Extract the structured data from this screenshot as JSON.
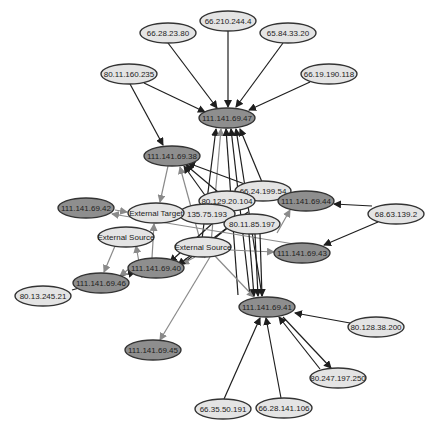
{
  "diagram": {
    "type": "network-graph",
    "colors": {
      "light_node_fill": "#e4e4e4",
      "dark_node_fill": "#8e8e8e",
      "node_stroke": "#333333",
      "dark_edge": "#1e1e1e",
      "gray_edge": "#8a8a8a",
      "background": "#ffffff"
    },
    "nodes": [
      {
        "id": "n1",
        "label": "66.28.23.80",
        "x": 168,
        "y": 33,
        "rx": 28,
        "ry": 10,
        "style": "light"
      },
      {
        "id": "n2",
        "label": "66.210.244.4",
        "x": 228,
        "y": 21,
        "rx": 28,
        "ry": 10,
        "style": "light"
      },
      {
        "id": "n3",
        "label": "65.84.33.20",
        "x": 288,
        "y": 33,
        "rx": 28,
        "ry": 10,
        "style": "light"
      },
      {
        "id": "n4",
        "label": "80.11.160.235",
        "x": 129,
        "y": 74,
        "rx": 28,
        "ry": 10,
        "style": "light"
      },
      {
        "id": "n5",
        "label": "66.19.190.118",
        "x": 329,
        "y": 74,
        "rx": 28,
        "ry": 10,
        "style": "light"
      },
      {
        "id": "n6",
        "label": "111.141.69.47",
        "x": 227,
        "y": 118,
        "rx": 28,
        "ry": 10,
        "style": "dark"
      },
      {
        "id": "n7",
        "label": "111.141.69.38",
        "x": 172,
        "y": 156,
        "rx": 28,
        "ry": 10,
        "style": "dark"
      },
      {
        "id": "n8",
        "label": "66.24.199.54",
        "x": 263,
        "y": 191,
        "rx": 28,
        "ry": 10,
        "style": "light"
      },
      {
        "id": "n9",
        "label": "80.129.20.104",
        "x": 227,
        "y": 201,
        "rx": 28,
        "ry": 10,
        "style": "light"
      },
      {
        "id": "n10",
        "label": "111.141.69.44",
        "x": 306,
        "y": 201,
        "rx": 28,
        "ry": 10,
        "style": "dark"
      },
      {
        "id": "n11",
        "label": "68.63.139.2",
        "x": 396,
        "y": 214,
        "rx": 28,
        "ry": 10,
        "style": "light"
      },
      {
        "id": "n12",
        "label": "111.141.69.42",
        "x": 86,
        "y": 208,
        "rx": 28,
        "ry": 10,
        "style": "dark"
      },
      {
        "id": "n13",
        "label": "135.75.193",
        "x": 207,
        "y": 214,
        "rx": 28,
        "ry": 10,
        "style": "light"
      },
      {
        "id": "n14",
        "label": "External Target",
        "x": 156,
        "y": 213,
        "rx": 28,
        "ry": 10,
        "style": "light"
      },
      {
        "id": "n15",
        "label": "80.11.85.197",
        "x": 252,
        "y": 224,
        "rx": 28,
        "ry": 10,
        "style": "light"
      },
      {
        "id": "n16",
        "label": "External Source",
        "x": 126,
        "y": 237,
        "rx": 28,
        "ry": 10,
        "style": "light"
      },
      {
        "id": "n17",
        "label": "External Source",
        "x": 203,
        "y": 247,
        "rx": 28,
        "ry": 10,
        "style": "light"
      },
      {
        "id": "n18",
        "label": "111.141.69.43",
        "x": 302,
        "y": 253,
        "rx": 28,
        "ry": 10,
        "style": "dark"
      },
      {
        "id": "n19",
        "label": "111.141.69.40",
        "x": 156,
        "y": 268,
        "rx": 28,
        "ry": 10,
        "style": "dark"
      },
      {
        "id": "n20",
        "label": "111.141.69.46",
        "x": 101,
        "y": 283,
        "rx": 28,
        "ry": 10,
        "style": "dark"
      },
      {
        "id": "n21",
        "label": "80.13.245.21",
        "x": 43,
        "y": 296,
        "rx": 28,
        "ry": 10,
        "style": "light"
      },
      {
        "id": "n22",
        "label": "111.141.69.41",
        "x": 267,
        "y": 307,
        "rx": 28,
        "ry": 10,
        "style": "dark"
      },
      {
        "id": "n23",
        "label": "80.128.38.200",
        "x": 376,
        "y": 327,
        "rx": 28,
        "ry": 10,
        "style": "light"
      },
      {
        "id": "n24",
        "label": "111.141.69.45",
        "x": 153,
        "y": 350,
        "rx": 28,
        "ry": 10,
        "style": "dark"
      },
      {
        "id": "n25",
        "label": "80.247.197.250",
        "x": 338,
        "y": 378,
        "rx": 28,
        "ry": 10,
        "style": "light"
      },
      {
        "id": "n26",
        "label": "66.35.50.191",
        "x": 223,
        "y": 409,
        "rx": 28,
        "ry": 10,
        "style": "light"
      },
      {
        "id": "n27",
        "label": "66.28.141.106",
        "x": 284,
        "y": 408,
        "rx": 28,
        "ry": 10,
        "style": "light"
      }
    ],
    "edges": [
      {
        "x1": 168,
        "y1": 43,
        "x2": 217,
        "y2": 108,
        "style": "dark"
      },
      {
        "x1": 228,
        "y1": 31,
        "x2": 228,
        "y2": 107,
        "style": "dark"
      },
      {
        "x1": 283,
        "y1": 43,
        "x2": 236,
        "y2": 107,
        "style": "dark"
      },
      {
        "x1": 144,
        "y1": 83,
        "x2": 205,
        "y2": 112,
        "style": "dark"
      },
      {
        "x1": 310,
        "y1": 82,
        "x2": 249,
        "y2": 110,
        "style": "dark"
      },
      {
        "x1": 130,
        "y1": 84,
        "x2": 163,
        "y2": 145,
        "style": "dark"
      },
      {
        "x1": 200,
        "y1": 255,
        "x2": 216,
        "y2": 129,
        "style": "dark"
      },
      {
        "x1": 210,
        "y1": 255,
        "x2": 221,
        "y2": 129,
        "style": "gray"
      },
      {
        "x1": 238,
        "y1": 295,
        "x2": 226,
        "y2": 129,
        "style": "dark"
      },
      {
        "x1": 250,
        "y1": 296,
        "x2": 231,
        "y2": 129,
        "style": "dark"
      },
      {
        "x1": 262,
        "y1": 296,
        "x2": 236,
        "y2": 129,
        "style": "dark"
      },
      {
        "x1": 262,
        "y1": 182,
        "x2": 240,
        "y2": 129,
        "style": "dark"
      },
      {
        "x1": 250,
        "y1": 186,
        "x2": 188,
        "y2": 163,
        "style": "dark"
      },
      {
        "x1": 218,
        "y1": 192,
        "x2": 186,
        "y2": 165,
        "style": "dark"
      },
      {
        "x1": 205,
        "y1": 258,
        "x2": 180,
        "y2": 167,
        "style": "gray"
      },
      {
        "x1": 212,
        "y1": 205,
        "x2": 184,
        "y2": 166,
        "style": "dark"
      },
      {
        "x1": 168,
        "y1": 166,
        "x2": 160,
        "y2": 202,
        "style": "gray"
      },
      {
        "x1": 115,
        "y1": 210,
        "x2": 127,
        "y2": 212,
        "style": "gray"
      },
      {
        "x1": 152,
        "y1": 258,
        "x2": 154,
        "y2": 224,
        "style": "gray"
      },
      {
        "x1": 142,
        "y1": 278,
        "x2": 136,
        "y2": 246,
        "style": "gray"
      },
      {
        "x1": 372,
        "y1": 206,
        "x2": 334,
        "y2": 204,
        "style": "dark"
      },
      {
        "x1": 378,
        "y1": 222,
        "x2": 324,
        "y2": 245,
        "style": "dark"
      },
      {
        "x1": 230,
        "y1": 250,
        "x2": 274,
        "y2": 252,
        "style": "gray"
      },
      {
        "x1": 277,
        "y1": 233,
        "x2": 290,
        "y2": 210,
        "style": "gray"
      },
      {
        "x1": 240,
        "y1": 218,
        "x2": 175,
        "y2": 270,
        "style": "dark"
      },
      {
        "x1": 225,
        "y1": 212,
        "x2": 170,
        "y2": 262,
        "style": "dark"
      },
      {
        "x1": 195,
        "y1": 257,
        "x2": 182,
        "y2": 264,
        "style": "gray"
      },
      {
        "x1": 248,
        "y1": 212,
        "x2": 178,
        "y2": 265,
        "style": "dark"
      },
      {
        "x1": 300,
        "y1": 245,
        "x2": 112,
        "y2": 214,
        "style": "gray"
      },
      {
        "x1": 72,
        "y1": 290,
        "x2": 135,
        "y2": 272,
        "style": "dark"
      },
      {
        "x1": 130,
        "y1": 268,
        "x2": 120,
        "y2": 276,
        "style": "gray"
      },
      {
        "x1": 115,
        "y1": 246,
        "x2": 104,
        "y2": 272,
        "style": "gray"
      },
      {
        "x1": 210,
        "y1": 257,
        "x2": 160,
        "y2": 340,
        "style": "gray"
      },
      {
        "x1": 215,
        "y1": 256,
        "x2": 254,
        "y2": 297,
        "style": "gray"
      },
      {
        "x1": 260,
        "y1": 234,
        "x2": 262,
        "y2": 296,
        "style": "dark"
      },
      {
        "x1": 255,
        "y1": 234,
        "x2": 258,
        "y2": 296,
        "style": "dark"
      },
      {
        "x1": 249,
        "y1": 234,
        "x2": 254,
        "y2": 296,
        "style": "dark"
      },
      {
        "x1": 350,
        "y1": 323,
        "x2": 295,
        "y2": 313,
        "style": "dark"
      },
      {
        "x1": 320,
        "y1": 369,
        "x2": 279,
        "y2": 317,
        "style": "dark"
      },
      {
        "x1": 283,
        "y1": 317,
        "x2": 331,
        "y2": 368,
        "style": "dark"
      },
      {
        "x1": 224,
        "y1": 399,
        "x2": 260,
        "y2": 318,
        "style": "dark"
      },
      {
        "x1": 281,
        "y1": 398,
        "x2": 266,
        "y2": 318,
        "style": "dark"
      }
    ]
  }
}
